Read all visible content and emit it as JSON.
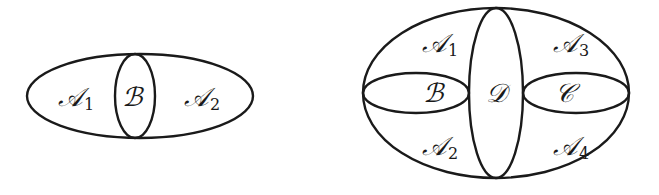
{
  "diagrams": [
    {
      "id": "left",
      "outer": {
        "cx": 140,
        "cy": 96,
        "rx": 113,
        "ry": 42
      },
      "regions": [
        {
          "name": "A",
          "sub": "1",
          "x": 62,
          "y": 106
        },
        {
          "name": "B",
          "sub": "",
          "x": 124,
          "y": 106
        },
        {
          "name": "A",
          "sub": "2",
          "x": 189,
          "y": 106
        }
      ],
      "inner": [
        {
          "label": "B",
          "cx": 135,
          "cy": 96,
          "rx": 20,
          "ry": 42
        }
      ]
    },
    {
      "id": "right",
      "outer": {
        "cx": 496,
        "cy": 93,
        "rx": 133,
        "ry": 85
      },
      "regions": [
        {
          "name": "A",
          "sub": "1",
          "x": 424,
          "y": 53
        },
        {
          "name": "A",
          "sub": "3",
          "x": 556,
          "y": 53
        },
        {
          "name": "B",
          "sub": "",
          "x": 424,
          "y": 102
        },
        {
          "name": "D",
          "sub": "",
          "x": 488,
          "y": 102
        },
        {
          "name": "C",
          "sub": "",
          "x": 556,
          "y": 102
        },
        {
          "name": "A",
          "sub": "2",
          "x": 424,
          "y": 155
        },
        {
          "name": "A",
          "sub": "4",
          "x": 556,
          "y": 155
        }
      ],
      "inner": [
        {
          "label": "D",
          "cx": 496,
          "cy": 93,
          "rx": 27,
          "ry": 85
        },
        {
          "label": "B",
          "cx": 416,
          "cy": 93,
          "rx": 53,
          "ry": 20
        },
        {
          "label": "C",
          "cx": 576,
          "cy": 93,
          "rx": 53,
          "ry": 20
        }
      ]
    }
  ],
  "labels": {
    "left_A1": "𝒜",
    "left_A1_sub": "1",
    "left_B": "ℬ",
    "left_A2": "𝒜",
    "left_A2_sub": "2",
    "right_A1": "𝒜",
    "right_A1_sub": "1",
    "right_A3": "𝒜",
    "right_A3_sub": "3",
    "right_B": "ℬ",
    "right_D": "𝒟",
    "right_C": "𝒞",
    "right_A2": "𝒜",
    "right_A2_sub": "2",
    "right_A4": "𝒜",
    "right_A4_sub": "4"
  }
}
